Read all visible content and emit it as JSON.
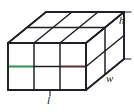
{
  "figure": {
    "name": "rectangular-prism-unit-cubes",
    "background_color": "#ffffff",
    "width": 134,
    "height": 112
  },
  "labels": {
    "height": "h",
    "width": "w",
    "length": "l"
  },
  "colors": {
    "edge": "#1f1f26",
    "edge_light": "#3c3c45",
    "highlight_pink": "#c0468f",
    "highlight_green": "#2f9e5e",
    "highlight_maroon": "#5e2b2b",
    "label": "#1a1a1a"
  },
  "geometry": {
    "projection": "oblique",
    "divisions_length": 3,
    "divisions_height": 2,
    "divisions_width": 2,
    "front_left_x": 8,
    "front_right_x": 86,
    "front_top_y": 43,
    "front_bottom_y": 90,
    "depth_dx": 38,
    "depth_dy": -31
  },
  "icons": {
    "prism": "cube-grid-icon"
  }
}
